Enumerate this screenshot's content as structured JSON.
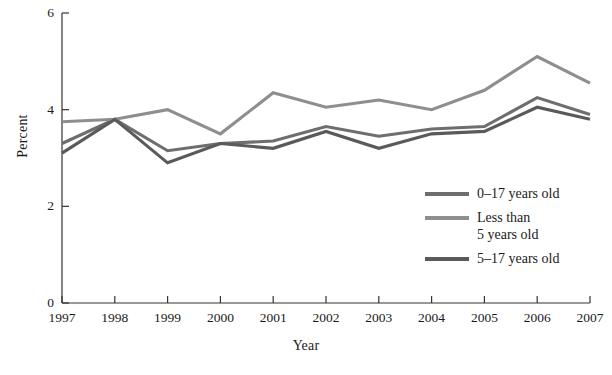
{
  "chart_data": {
    "type": "line",
    "title": "",
    "xlabel": "Year",
    "ylabel": "Percent",
    "categories": [
      "1997",
      "1998",
      "1999",
      "2000",
      "2001",
      "2002",
      "2003",
      "2004",
      "2005",
      "2006",
      "2007"
    ],
    "x": [
      1997,
      1998,
      1999,
      2000,
      2001,
      2002,
      2003,
      2004,
      2005,
      2006,
      2007
    ],
    "xlim": [
      1997,
      2007
    ],
    "ylim": [
      0,
      6
    ],
    "yticks": [
      0,
      2,
      4,
      6
    ],
    "ytick_labels": [
      "0",
      "2",
      "4",
      "6"
    ],
    "grid": false,
    "legend_position": "inside-lower-right",
    "series": [
      {
        "name": "0–17 years old",
        "color": "#6e6e6e",
        "values": [
          3.3,
          3.8,
          3.15,
          3.3,
          3.35,
          3.65,
          3.45,
          3.6,
          3.65,
          4.25,
          3.9
        ]
      },
      {
        "name": "Less than\n5 years old",
        "color": "#8e8e8e",
        "values": [
          3.75,
          3.8,
          4.0,
          3.5,
          4.35,
          4.05,
          4.2,
          4.0,
          4.4,
          5.1,
          4.55
        ]
      },
      {
        "name": "5–17 years old",
        "color": "#5a5a5a",
        "values": [
          3.1,
          3.8,
          2.9,
          3.3,
          3.2,
          3.55,
          3.2,
          3.5,
          3.55,
          4.05,
          3.8
        ]
      }
    ]
  },
  "axes": {
    "ylabel": "Percent",
    "xlabel": "Year"
  },
  "legend": {
    "items": [
      {
        "label": "0–17 years old"
      },
      {
        "label": "Less than\n5 years old"
      },
      {
        "label": "5–17 years old"
      }
    ]
  }
}
